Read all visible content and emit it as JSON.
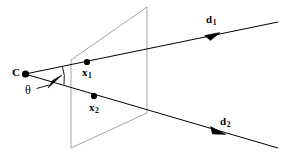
{
  "figure": {
    "kind": "geometry-diagram",
    "background_color": "#ffffff",
    "stroke_color": "#000000",
    "plane_stroke_color": "#8a8a8a",
    "labels": {
      "camera_center": "C",
      "point_1": "x",
      "point_1_sub": "1",
      "point_2": "x",
      "point_2_sub": "2",
      "direction_1": "d",
      "direction_1_sub": "1",
      "direction_2": "d",
      "direction_2_sub": "2",
      "angle": "θ"
    },
    "geometry": {
      "camera_center_point": [
        25,
        74
      ],
      "point_1": [
        87,
        62
      ],
      "point_2": [
        94,
        96
      ],
      "ray_1_end": [
        278,
        22
      ],
      "ray_2_end": [
        278,
        148
      ],
      "plane_corners": [
        [
          71,
          60
        ],
        [
          147,
          7
        ],
        [
          147,
          113
        ],
        [
          71,
          148
        ]
      ],
      "angle_arc_radius": 38,
      "arrow_1_at": [
        214,
        36
      ],
      "arrow_2_at": [
        219,
        131
      ],
      "theta_leader_from": [
        36,
        88
      ],
      "theta_leader_to": [
        52,
        83
      ]
    }
  }
}
